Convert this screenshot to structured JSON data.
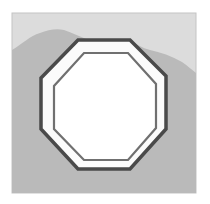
{
  "icon": {
    "name": "octagon-stop-icon",
    "description": "Grayscale octagon frame over landscape background",
    "colors": {
      "page_background": "#ffffff",
      "frame_border": "#bdbdbd",
      "sky": "#dedede",
      "hills": "#b9b9b9",
      "ground": "#bcbcbc",
      "outer_octagon_stroke": "#4a4a4a",
      "octagon_band": "#fbfbfb",
      "inner_octagon_stroke": "#6e6e6e",
      "inner_fill": "#ffffff"
    }
  }
}
